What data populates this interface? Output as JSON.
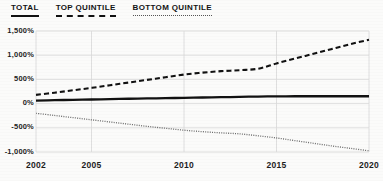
{
  "legend": {
    "items": [
      {
        "label": "TOTAL",
        "style": "solid"
      },
      {
        "label": "TOP QUINTILE",
        "style": "dashed"
      },
      {
        "label": "BOTTOM QUINTILE",
        "style": "dotted"
      }
    ]
  },
  "axes": {
    "y_ticks": [
      "1,500%",
      "1,000%",
      "500%",
      "0%",
      "-500%",
      "-1,000%"
    ],
    "x_ticks": [
      "2002",
      "2005",
      "2010",
      "2015",
      "2020"
    ]
  },
  "colors": {
    "total_line": "#111111",
    "top_quintile_line": "#111111",
    "bottom_quintile_line": "#6a6a6a",
    "gridline": "#d8d8d8",
    "background": "#fbfbfa",
    "text": "#1a1a1a"
  },
  "chart_data": {
    "type": "line",
    "title": "",
    "xlabel": "",
    "ylabel": "",
    "xlim": [
      2002,
      2020
    ],
    "ylim": [
      -1000,
      1500
    ],
    "grid": true,
    "legend_position": "top-left",
    "y_tick_values": [
      1500,
      1000,
      500,
      0,
      -500,
      -1000
    ],
    "x_tick_values": [
      2002,
      2005,
      2010,
      2015,
      2020
    ],
    "x": [
      2002,
      2003,
      2004,
      2005,
      2006,
      2007,
      2008,
      2009,
      2010,
      2011,
      2012,
      2013,
      2014,
      2015,
      2016,
      2017,
      2018,
      2019,
      2020
    ],
    "series": [
      {
        "name": "TOTAL",
        "style": "solid",
        "values": [
          60,
          70,
          78,
          85,
          93,
          100,
          106,
          112,
          120,
          126,
          132,
          138,
          146,
          150,
          152,
          152,
          152,
          152,
          152
        ]
      },
      {
        "name": "TOP QUINTILE",
        "style": "dashed",
        "values": [
          180,
          225,
          275,
          325,
          380,
          435,
          490,
          545,
          600,
          640,
          670,
          690,
          720,
          830,
          930,
          1030,
          1130,
          1230,
          1320
        ]
      },
      {
        "name": "BOTTOM QUINTILE",
        "style": "dotted",
        "values": [
          -200,
          -245,
          -290,
          -335,
          -380,
          -425,
          -470,
          -510,
          -550,
          -580,
          -605,
          -625,
          -665,
          -710,
          -765,
          -820,
          -875,
          -925,
          -975
        ]
      }
    ]
  }
}
